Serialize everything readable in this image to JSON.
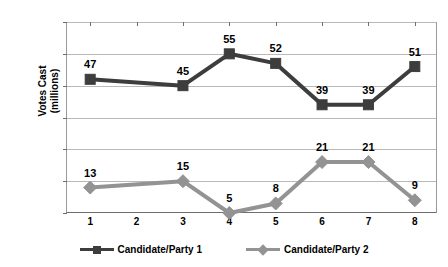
{
  "chart_data": {
    "type": "line",
    "title": "",
    "xlabel": "",
    "ylabel": "Votes Cast (millions)",
    "ylabel_lines": [
      "Votes Cast",
      "(millions)"
    ],
    "categories": [
      "1",
      "2",
      "3",
      "4",
      "5",
      "6",
      "7",
      "8"
    ],
    "x": [
      1,
      2,
      3,
      4,
      5,
      6,
      7,
      8
    ],
    "ylim": [
      5,
      65
    ],
    "yticks": [
      5,
      15,
      25,
      35,
      45,
      55,
      65
    ],
    "ytick_labels": [
      "5",
      "15",
      "25",
      "35",
      "45",
      "55",
      "65"
    ],
    "grid": "horizontal",
    "legend_position": "bottom",
    "data_labels": true,
    "series": [
      {
        "name": "Candidate/Party 1",
        "color": "#3d3d3d",
        "marker": "square",
        "values": [
          47,
          null,
          45,
          55,
          52,
          39,
          39,
          51
        ],
        "labels": [
          "47",
          "",
          "45",
          "55",
          "52",
          "39",
          "39",
          "51"
        ]
      },
      {
        "name": "Candidate/Party 2",
        "color": "#939393",
        "marker": "diamond",
        "values": [
          13,
          null,
          15,
          5,
          8,
          21,
          21,
          9
        ],
        "labels": [
          "13",
          "",
          "15",
          "5",
          "8",
          "21",
          "21",
          "9"
        ]
      }
    ]
  }
}
